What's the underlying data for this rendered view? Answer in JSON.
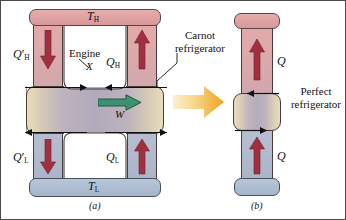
{
  "figure": {
    "panels": [
      {
        "key": "a",
        "caption": "(a)"
      },
      {
        "key": "b",
        "caption": "(b)"
      }
    ]
  },
  "colors": {
    "hot_reservoir": "#e0a3a3",
    "cold_reservoir": "#aebdd2",
    "heat_arrow": "#a03040",
    "work_arrow": "#2e7d5b",
    "transform_arrow_start": "#f7e2a8",
    "transform_arrow_end": "#f0a32a",
    "machine_body": "#b4acbd",
    "machine_edge": "#e8dcbe",
    "outline": "#4a3c3c",
    "text": "#14120f"
  },
  "panel_a": {
    "hot_reservoir_label": "T",
    "hot_reservoir_sub": "H",
    "cold_reservoir_label": "T",
    "cold_reservoir_sub": "L",
    "q_hot_prime": "Q",
    "q_hot_prime_mark": "′",
    "q_hot_prime_sub": "H",
    "q_hot": "Q",
    "q_hot_sub": "H",
    "q_cold_prime": "Q",
    "q_cold_prime_mark": "′",
    "q_cold_prime_sub": "L",
    "q_cold": "Q",
    "q_cold_sub": "L",
    "engine_label": "Engine",
    "engine_name": "X",
    "work_label": "W",
    "carnot_label": "Carnot\nrefrigerator",
    "carnot_line1": "Carnot",
    "carnot_line2": "refrigerator",
    "caption": "(a)",
    "arrow_q_hot_prime_dir": "down",
    "arrow_q_hot_dir": "up",
    "arrow_q_cold_prime_dir": "down",
    "arrow_q_cold_dir": "up",
    "arrow_work_dir": "right"
  },
  "panel_b": {
    "q_top": "Q",
    "q_bottom": "Q",
    "perfect_line1": "Perfect",
    "perfect_line2": "refrigerator",
    "caption": "(b)",
    "arrow_q_top_dir": "up",
    "arrow_q_bottom_dir": "up"
  },
  "transform": {
    "arrow_name": "equivalence-arrow",
    "direction": "right"
  }
}
